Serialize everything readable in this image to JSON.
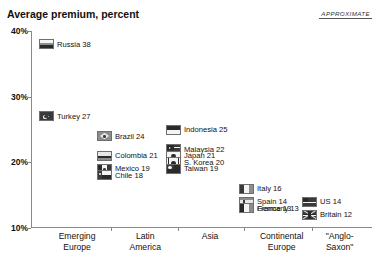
{
  "headline_remnant": "A PREMIUM FOR EMERGING MARKETS PAY THOSE FOR WELL-GOVERNED COMPANIES",
  "subtitle": "Average premium, percent",
  "approximate_tag": "APPROXIMATE",
  "chart_data": {
    "type": "scatter",
    "title": "Average premium, percent",
    "xlabel": "",
    "ylabel": "Average premium, percent",
    "ylim": [
      10,
      40
    ],
    "yticks": [
      "10%",
      "20%",
      "30%",
      "40%"
    ],
    "ytick_values": [
      10,
      20,
      30,
      40
    ],
    "grid": false,
    "legend": "none",
    "annotation": "APPROXIMATE",
    "categories": [
      "Emerging Europe",
      "Latin America",
      "Asia",
      "Continental Europe",
      "\"Anglo-Saxon\""
    ],
    "series": [
      {
        "name": "Emerging Europe",
        "points": [
          {
            "label": "Russia 38",
            "country": "Russia",
            "value": 38,
            "flag": "russia-flag-icon"
          },
          {
            "label": "Turkey 27",
            "country": "Turkey",
            "value": 27,
            "flag": "turkey-flag-icon"
          }
        ]
      },
      {
        "name": "Latin America",
        "points": [
          {
            "label": "Brazil 24",
            "country": "Brazil",
            "value": 24,
            "flag": "brazil-flag-icon"
          },
          {
            "label": "Colombia 21",
            "country": "Colombia",
            "value": 21,
            "flag": "colombia-flag-icon"
          },
          {
            "label": "Mexico 19",
            "country": "Mexico",
            "value": 19,
            "flag": "mexico-flag-icon"
          },
          {
            "label": "Chile 18",
            "country": "Chile",
            "value": 18,
            "flag": "chile-flag-icon"
          }
        ]
      },
      {
        "name": "Asia",
        "points": [
          {
            "label": "Indonesia 25",
            "country": "Indonesia",
            "value": 25,
            "flag": "indonesia-flag-icon"
          },
          {
            "label": "Malaysia 22",
            "country": "Malaysia",
            "value": 22,
            "flag": "malaysia-flag-icon"
          },
          {
            "label": "Japan 21",
            "country": "Japan",
            "value": 21,
            "flag": "japan-flag-icon"
          },
          {
            "label": "S. Korea  20",
            "country": "S. Korea",
            "value": 20,
            "flag": "south-korea-flag-icon"
          },
          {
            "label": "Taiwan 19",
            "country": "Taiwan",
            "value": 19,
            "flag": "taiwan-flag-icon"
          }
        ]
      },
      {
        "name": "Continental Europe",
        "points": [
          {
            "label": "Italy 16",
            "country": "Italy",
            "value": 16,
            "flag": "italy-flag-icon"
          },
          {
            "label": "Spain  14",
            "country": "Spain",
            "value": 14,
            "flag": "spain-flag-icon"
          },
          {
            "label": "Germany 13",
            "country": "Germany",
            "value": 13,
            "flag": "germany-flag-icon"
          },
          {
            "label": "France 13",
            "country": "France",
            "value": 13,
            "flag": "france-flag-icon"
          }
        ]
      },
      {
        "name": "\"Anglo-Saxon\"",
        "points": [
          {
            "label": "US 14",
            "country": "US",
            "value": 14,
            "flag": "us-flag-icon"
          },
          {
            "label": "Britain  12",
            "country": "Britain",
            "value": 12,
            "flag": "britain-flag-icon"
          }
        ]
      }
    ]
  }
}
